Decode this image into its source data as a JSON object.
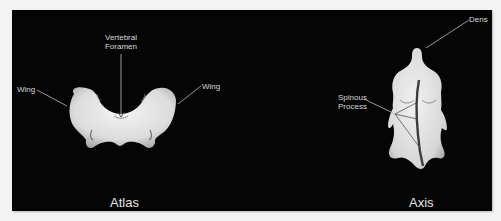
{
  "figure": {
    "background_color": "#f3f3f3",
    "panel_color": "#050505",
    "label_color": "#d8d8d8",
    "bone_color": "#e4e4e4"
  },
  "atlas": {
    "title": "Atlas",
    "labels": {
      "wing_left": "Wing",
      "wing_right": "Wing",
      "foramen_line1": "Vertebral",
      "foramen_line2": "Foramen"
    }
  },
  "axis": {
    "title": "Axis",
    "labels": {
      "dens": "Dens",
      "spinous_line1": "Spinous",
      "spinous_line2": "Process"
    }
  }
}
